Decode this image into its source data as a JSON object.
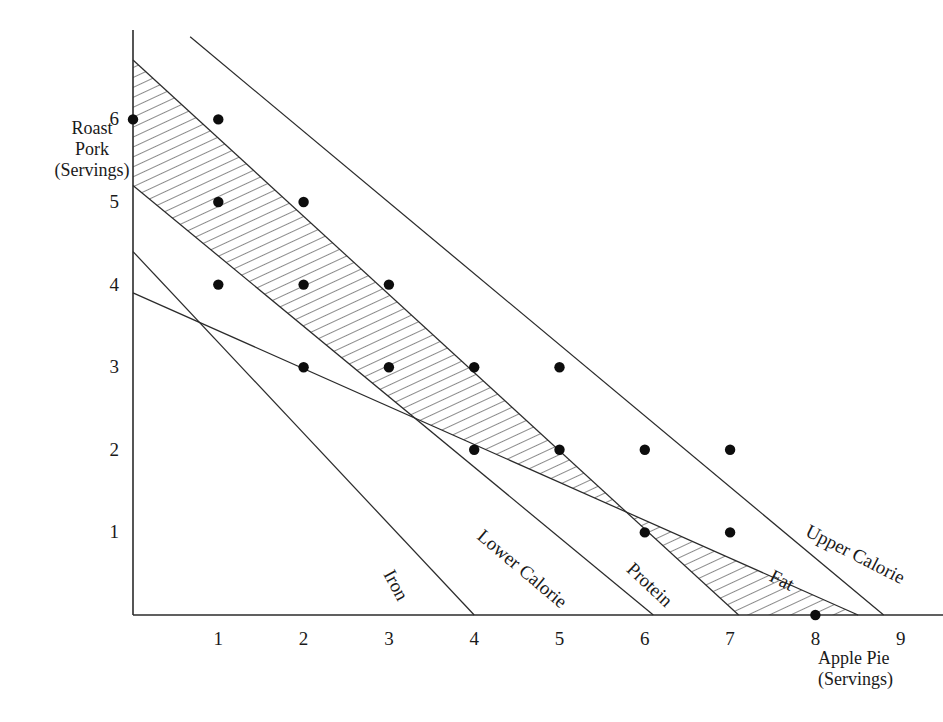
{
  "chart_data": {
    "type": "scatter",
    "title": "",
    "subtitle": "",
    "xlabel": "Apple Pie (Servings)",
    "ylabel": "Roast Pork (Servings)",
    "xlim": [
      0,
      9.6
    ],
    "ylim": [
      0,
      7.0
    ],
    "xticks": [
      1,
      2,
      3,
      4,
      5,
      6,
      7,
      8,
      9
    ],
    "yticks": [
      1,
      2,
      3,
      4,
      5,
      6
    ],
    "grid": false,
    "legend_position": "inline-line-labels",
    "shading": "diagonal-hatch feasible band between Protein (upper) and Lower Calorie / Fat (lower)",
    "marker": "filled-black-circle",
    "annotations": [
      "Feasible integer solutions shown as filled dots inside the hatched band"
    ],
    "points": [
      {
        "x": 0,
        "y": 6
      },
      {
        "x": 1,
        "y": 6
      },
      {
        "x": 1,
        "y": 5
      },
      {
        "x": 2,
        "y": 5
      },
      {
        "x": 1,
        "y": 4
      },
      {
        "x": 2,
        "y": 4
      },
      {
        "x": 3,
        "y": 4
      },
      {
        "x": 2,
        "y": 3
      },
      {
        "x": 3,
        "y": 3
      },
      {
        "x": 4,
        "y": 3
      },
      {
        "x": 5,
        "y": 3
      },
      {
        "x": 4,
        "y": 2
      },
      {
        "x": 5,
        "y": 2
      },
      {
        "x": 6,
        "y": 2
      },
      {
        "x": 7,
        "y": 2
      },
      {
        "x": 6,
        "y": 1
      },
      {
        "x": 7,
        "y": 1
      },
      {
        "x": 8,
        "y": 0
      }
    ],
    "constraint_lines": [
      {
        "name": "Upper Calorie",
        "label": "Upper Calorie",
        "x0": 0.67,
        "y0": 7.0,
        "x1": 8.8,
        "y1": 0.0,
        "role": "upper bound"
      },
      {
        "name": "Protein",
        "label": "Protein",
        "x0": 0.0,
        "y0": 6.72,
        "x1": 7.1,
        "y1": 0.0,
        "role": "upper bound of hatch"
      },
      {
        "name": "Lower Calorie",
        "label": "Lower Calorie",
        "x0": 0.0,
        "y0": 5.2,
        "x1": 6.1,
        "y1": 0.0,
        "role": "lower bound"
      },
      {
        "name": "Iron",
        "label": "Iron",
        "x0": 0.0,
        "y0": 4.4,
        "x1": 4.0,
        "y1": 0.0,
        "role": "lower bound"
      },
      {
        "name": "Fat",
        "label": "Fat",
        "x0": 0.0,
        "y0": 3.9,
        "x1": 8.5,
        "y1": 0.0,
        "role": "lower bound of hatch"
      }
    ],
    "line_label_positions": [
      {
        "name": "Upper Calorie",
        "x_px": 812,
        "y_px": 520,
        "rotation_deg": 27
      },
      {
        "name": "Fat",
        "x_px": 776,
        "y_px": 565,
        "rotation_deg": 27
      },
      {
        "name": "Protein",
        "x_px": 637,
        "y_px": 558,
        "rotation_deg": 43
      },
      {
        "name": "Lower Calorie",
        "x_px": 487,
        "y_px": 525,
        "rotation_deg": 40
      },
      {
        "name": "Iron",
        "x_px": 398,
        "y_px": 566,
        "rotation_deg": 62
      }
    ]
  },
  "axes": {
    "y": {
      "title_lines": [
        "Roast",
        "Pork",
        "(Servings)"
      ],
      "ticks": [
        {
          "value": "6"
        },
        {
          "value": "5"
        },
        {
          "value": "4"
        },
        {
          "value": "3"
        },
        {
          "value": "2"
        },
        {
          "value": "1"
        }
      ]
    },
    "x": {
      "title_lines": [
        "Apple Pie",
        "(Servings)"
      ],
      "ticks": [
        {
          "value": "1"
        },
        {
          "value": "2"
        },
        {
          "value": "3"
        },
        {
          "value": "4"
        },
        {
          "value": "5"
        },
        {
          "value": "6"
        },
        {
          "value": "7"
        },
        {
          "value": "8"
        },
        {
          "value": "9"
        }
      ]
    }
  },
  "colors": {
    "ink": "#1a1a1a",
    "line": "#2b2b2b",
    "hatch": "#333333",
    "marker": "#0d0d0d",
    "background": "#ffffff"
  }
}
